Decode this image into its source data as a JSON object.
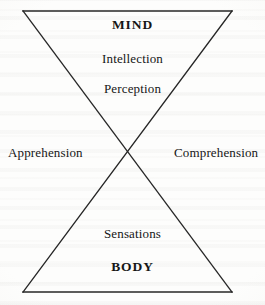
{
  "figure": {
    "type": "hourglass-bowtie-diagram",
    "background_color": "#fdfdfc",
    "line_color": "#262626",
    "text_color": "#161616"
  },
  "labels": {
    "top_apex": "MIND",
    "upper_middle": "Intellection",
    "upper_lower": "Perception",
    "left": "Apprehension",
    "right": "Comprehension",
    "lower_upper": "Sensations",
    "bottom_apex": "BODY"
  },
  "geometry": {
    "top_left": {
      "x": 23,
      "y": 11
    },
    "top_right": {
      "x": 232,
      "y": 11
    },
    "bottom_left": {
      "x": 23,
      "y": 292
    },
    "bottom_right": {
      "x": 232,
      "y": 292
    },
    "center": {
      "x": 127,
      "y": 152
    },
    "stroke_width": 1.3
  }
}
